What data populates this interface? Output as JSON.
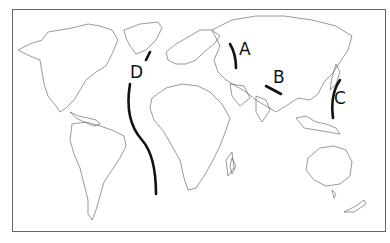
{
  "map": {
    "type": "world outline map",
    "labels": [
      {
        "id": "A",
        "text": "A",
        "location": "west of Ural Mountains (Russia)"
      },
      {
        "id": "B",
        "text": "B",
        "location": "Central Asia / Himalaya region"
      },
      {
        "id": "C",
        "text": "C",
        "location": "east of Japan / Western Pacific"
      },
      {
        "id": "D",
        "text": "D",
        "location": "Mid-Atlantic"
      }
    ],
    "colors": {
      "outline": "#444444",
      "boundary": "#111111",
      "background": "#ffffff"
    }
  }
}
